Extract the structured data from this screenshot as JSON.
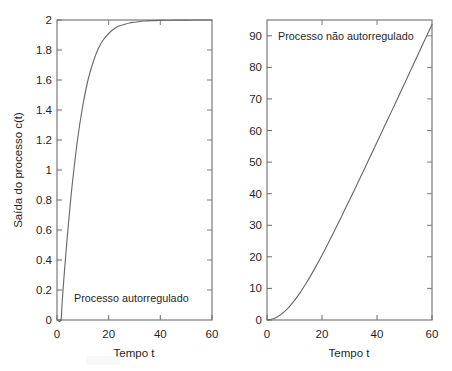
{
  "figure": {
    "background_color": "#ffffff",
    "axis_color": "#6e6e6e",
    "curve_color": "#6a6a6a",
    "text_color": "#1f1f1f"
  },
  "chart_data": [
    {
      "type": "line",
      "panel": "left",
      "title": "",
      "annotation": "Processo autorregulado",
      "xlabel": "Tempo  t",
      "ylabel": "Saída do processo c(t)",
      "xlim": [
        0,
        60
      ],
      "ylim": [
        0,
        2
      ],
      "xticks": [
        0,
        20,
        40,
        60
      ],
      "xtick_labels": [
        "0",
        "20",
        "40",
        "60"
      ],
      "yticks": [
        0,
        0.2,
        0.4,
        0.6,
        0.8,
        1,
        1.2,
        1.4,
        1.6,
        1.8,
        2
      ],
      "ytick_labels": [
        "0",
        "0.2",
        "0.4",
        "0.6",
        "0.8",
        "1",
        "1.2",
        "1.4",
        "1.6",
        "1.8",
        "2"
      ],
      "grid": false,
      "legend": "none",
      "series": [
        {
          "name": "Processo autorregulado",
          "description": "Resposta de primeira ordem com tempo morto, ganho 2, constante de tempo 8, atraso 1.5",
          "x": [
            0,
            1.5,
            2,
            3,
            4,
            5,
            6,
            8,
            10,
            12,
            14,
            16,
            18,
            20,
            22,
            24,
            26,
            28,
            30,
            34,
            38,
            42,
            46,
            50,
            55,
            60
          ],
          "y": [
            0,
            0,
            0.12,
            0.35,
            0.56,
            0.75,
            0.92,
            1.21,
            1.43,
            1.6,
            1.72,
            1.81,
            1.87,
            1.91,
            1.94,
            1.96,
            1.97,
            1.98,
            1.985,
            1.993,
            1.996,
            1.998,
            1.999,
            1.999,
            2.0,
            2.0
          ]
        }
      ]
    },
    {
      "type": "line",
      "panel": "right",
      "title": "",
      "annotation": "Processo não autorregulado",
      "xlabel": "Tempo  t",
      "ylabel": "",
      "xlim": [
        0,
        60
      ],
      "ylim": [
        0,
        95
      ],
      "xticks": [
        0,
        20,
        40,
        60
      ],
      "xtick_labels": [
        "0",
        "20",
        "40",
        "60"
      ],
      "yticks": [
        0,
        10,
        20,
        30,
        40,
        50,
        60,
        70,
        80,
        90
      ],
      "ytick_labels": [
        "0",
        "10",
        "20",
        "30",
        "40",
        "50",
        "60",
        "70",
        "80",
        "90"
      ],
      "grid": false,
      "legend": "none",
      "series": [
        {
          "name": "Processo não autorregulado",
          "description": "Resposta integradora: rampa com curvatura inicial, atinge cerca de 95 em t=60",
          "x": [
            0,
            2,
            4,
            6,
            8,
            10,
            12,
            14,
            16,
            18,
            20,
            24,
            28,
            32,
            36,
            40,
            44,
            48,
            52,
            56,
            60
          ],
          "y": [
            0,
            0.3,
            1.1,
            2.4,
            4.1,
            6.2,
            8.6,
            11.3,
            14.2,
            17.3,
            20.5,
            27.3,
            34.4,
            41.6,
            48.9,
            56.3,
            63.7,
            71.1,
            78.6,
            86.1,
            93.6
          ]
        }
      ]
    }
  ]
}
